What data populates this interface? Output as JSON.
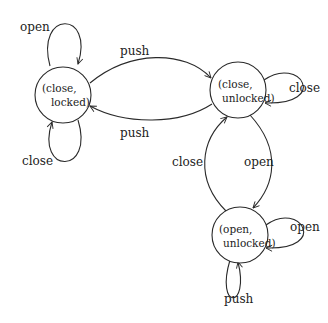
{
  "diagram": {
    "type": "state-machine",
    "nodes": [
      {
        "id": "cl",
        "line1": "(close,",
        "line2": "locked)"
      },
      {
        "id": "cu",
        "line1": "(close,",
        "line2": "unlocked)"
      },
      {
        "id": "ou",
        "line1": "(open,",
        "line2": "unlocked)"
      }
    ],
    "edges": [
      {
        "from": "cl",
        "to": "cl",
        "label": "open"
      },
      {
        "from": "cl",
        "to": "cl",
        "label": "close"
      },
      {
        "from": "cl",
        "to": "cu",
        "label": "push"
      },
      {
        "from": "cu",
        "to": "cl",
        "label": "push"
      },
      {
        "from": "cu",
        "to": "cu",
        "label": "close"
      },
      {
        "from": "cu",
        "to": "ou",
        "label": "open"
      },
      {
        "from": "ou",
        "to": "cu",
        "label": "close"
      },
      {
        "from": "ou",
        "to": "ou",
        "label": "open"
      },
      {
        "from": "ou",
        "to": "ou",
        "label": "push"
      }
    ]
  }
}
